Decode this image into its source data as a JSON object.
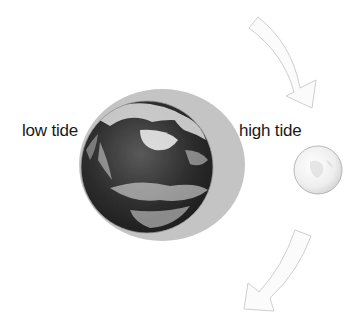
{
  "diagram": {
    "labels": {
      "low_tide": "low tide",
      "high_tide": "high tide"
    },
    "bodies": {
      "earth": {
        "name": "Earth",
        "cx": 147,
        "cy": 167,
        "r": 66
      },
      "tidal_bulge": {
        "name": "Tidal bulge",
        "cx": 162,
        "cy": 165,
        "rx": 83,
        "ry": 76,
        "color": "#c4c4c4"
      },
      "moon": {
        "name": "Moon",
        "cx": 318,
        "cy": 170,
        "r": 24
      }
    },
    "arrows": [
      {
        "name": "orbit-arrow-top",
        "direction": "clockwise-down"
      },
      {
        "name": "orbit-arrow-bottom",
        "direction": "clockwise-down-left"
      }
    ],
    "colors": {
      "background": "#ffffff",
      "bulge": "#c4c4c4",
      "earth_dark": "#2a2a2a",
      "cloud": "#e8e8e8",
      "arrow_fill": "#fbfbfb",
      "arrow_stroke": "#c8c8c8",
      "text": "#1a1a1a"
    }
  }
}
